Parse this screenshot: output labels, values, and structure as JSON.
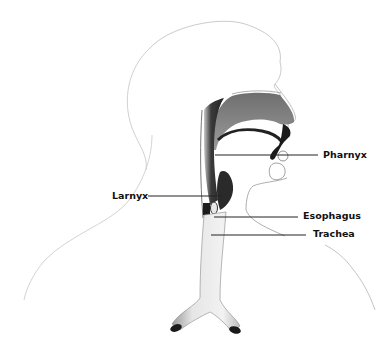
{
  "diagram": {
    "labels": {
      "pharynx": "Pharnyx",
      "larynx": "Larnyx",
      "esophagus": "Esophagus",
      "trachea": "Trachea"
    },
    "colors": {
      "outline": "#b9b9b9",
      "shading_dark": "#1a1a1a",
      "shading_mid": "#6e6e6e",
      "leader_line": "#222222",
      "text": "#111111",
      "background": "#ffffff"
    }
  }
}
